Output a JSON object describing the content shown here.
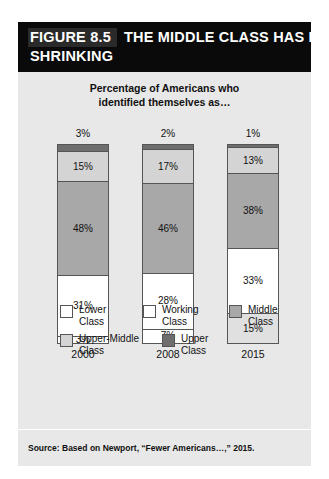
{
  "figure": {
    "number_label": "FIGURE 8.5",
    "title_line_1": "THE MIDDLE CLASS HAS BEEN",
    "title_line_2": "SHRINKING",
    "subtitle_line_1": "Percentage of Americans who",
    "subtitle_line_2": "identified themselves as…",
    "source": "Source: Based on Newport, “Fewer Americans…,” 2015."
  },
  "legend": {
    "row1": [
      {
        "label_line_1": "Lower",
        "label_line_2": "Class",
        "color": "#ffffff"
      },
      {
        "label_line_1": "Working",
        "label_line_2": "Class",
        "color": "#ffffff"
      },
      {
        "label_line_1": "Middle",
        "label_line_2": "Class",
        "color": "#a8a8a8"
      }
    ],
    "row2": [
      {
        "label_line_1": "Upper-Middle",
        "label_line_2": "Class",
        "color": "#d4d4d4"
      },
      {
        "label_line_1": "Upper",
        "label_line_2": "Class",
        "color": "#6e6e6e"
      }
    ]
  },
  "chart_data": {
    "type": "bar",
    "subtype": "stacked-100",
    "title": "THE MIDDLE CLASS HAS BEEN SHRINKING",
    "subtitle": "Percentage of Americans who identified themselves as…",
    "xlabel": "",
    "ylabel": "",
    "ylim": [
      0,
      100
    ],
    "grid": false,
    "legend_position": "bottom",
    "categories": [
      "2000",
      "2008",
      "2015"
    ],
    "series": [
      {
        "name": "Lower Class",
        "values": [
          3,
          7,
          15
        ],
        "color": "#ffffff"
      },
      {
        "name": "Working Class",
        "values": [
          31,
          28,
          33
        ],
        "color": "#ffffff"
      },
      {
        "name": "Middle Class",
        "values": [
          48,
          46,
          38
        ],
        "color": "#a8a8a8"
      },
      {
        "name": "Upper-Middle Class",
        "values": [
          15,
          17,
          13
        ],
        "color": "#d4d4d4"
      },
      {
        "name": "Upper Class",
        "values": [
          3,
          2,
          1
        ],
        "color": "#6e6e6e"
      }
    ],
    "annotations": [
      "Top-of-bar labels show the Upper Class share: 3% (2000), 2% (2008), 1% (2015)"
    ]
  },
  "columns": [
    {
      "year": "2000",
      "top_label": "3%",
      "segments": [
        {
          "label": "3%",
          "pct": 3,
          "color": "#6e6e6e",
          "show_label": false
        },
        {
          "label": "15%",
          "pct": 15,
          "color": "#d4d4d4",
          "show_label": true
        },
        {
          "label": "48%",
          "pct": 48,
          "color": "#a8a8a8",
          "show_label": true
        },
        {
          "label": "31%",
          "pct": 31,
          "color": "#ffffff",
          "show_label": true
        },
        {
          "label": "3%",
          "pct": 3,
          "color": "#ffffff",
          "show_label": true
        }
      ]
    },
    {
      "year": "2008",
      "top_label": "2%",
      "segments": [
        {
          "label": "2%",
          "pct": 2,
          "color": "#6e6e6e",
          "show_label": false
        },
        {
          "label": "17%",
          "pct": 17,
          "color": "#d4d4d4",
          "show_label": true
        },
        {
          "label": "46%",
          "pct": 46,
          "color": "#a8a8a8",
          "show_label": true
        },
        {
          "label": "28%",
          "pct": 28,
          "color": "#ffffff",
          "show_label": true
        },
        {
          "label": "7%",
          "pct": 7,
          "color": "#ffffff",
          "show_label": true
        }
      ]
    },
    {
      "year": "2015",
      "top_label": "1%",
      "segments": [
        {
          "label": "1%",
          "pct": 1,
          "color": "#6e6e6e",
          "show_label": false
        },
        {
          "label": "13%",
          "pct": 13,
          "color": "#d4d4d4",
          "show_label": true
        },
        {
          "label": "38%",
          "pct": 38,
          "color": "#a8a8a8",
          "show_label": true
        },
        {
          "label": "33%",
          "pct": 33,
          "color": "#ffffff",
          "show_label": true
        },
        {
          "label": "15%",
          "pct": 15,
          "color": "#e0e0e0",
          "show_label": true
        }
      ]
    }
  ]
}
